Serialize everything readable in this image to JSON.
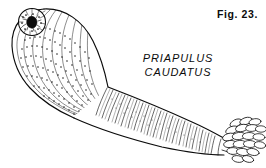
{
  "plate": {
    "background_color": "#ffffff",
    "ink_color": "#0b0b0b",
    "width": 266,
    "height": 168
  },
  "figure_label": {
    "text": "Fig. 23."
  },
  "caption": {
    "genus": "PRIAPULUS",
    "species": "CAUDATUS"
  },
  "illustration": {
    "subject_name": "priapulid-worm",
    "parts": [
      {
        "name": "proboscis",
        "label": "proboscis"
      },
      {
        "name": "mouth",
        "label": "mouth"
      },
      {
        "name": "trunk",
        "label": "annulated trunk"
      },
      {
        "name": "caudal-appendage",
        "label": "caudal appendage"
      }
    ]
  }
}
